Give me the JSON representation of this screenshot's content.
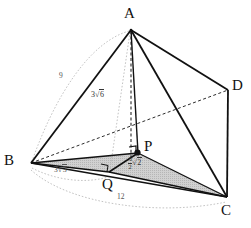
{
  "figure": {
    "background_color": "#ffffff",
    "stroke_color": "#111111",
    "hidden_stroke_color": "#333333",
    "guide_color": "#aaaaaa",
    "shaded_fill": "#c9c9c9"
  },
  "vertices": [
    {
      "id": "A",
      "label": "A",
      "x": 131,
      "y": 18,
      "label_x": 126,
      "label_y": 8,
      "point_x": 131,
      "point_y": 30
    },
    {
      "id": "B",
      "label": "B",
      "x": 31,
      "y": 163,
      "label_x": 5,
      "label_y": 155,
      "point_x": 31,
      "point_y": 163
    },
    {
      "id": "C",
      "label": "C",
      "x": 227,
      "y": 197,
      "label_x": 222,
      "label_y": 203,
      "point_x": 227,
      "point_y": 197
    },
    {
      "id": "D",
      "label": "D",
      "x": 228,
      "y": 90,
      "label_x": 233,
      "label_y": 79,
      "point_x": 228,
      "point_y": 90
    },
    {
      "id": "P",
      "label": "P",
      "x": 138,
      "y": 153,
      "label_x": 145,
      "label_y": 141,
      "point_x": 138,
      "point_y": 153
    },
    {
      "id": "Q",
      "label": "Q",
      "x": 109,
      "y": 172,
      "label_x": 103,
      "label_y": 178,
      "point_x": 109,
      "point_y": 172
    }
  ],
  "measurements": [
    {
      "id": "edge-AB",
      "text": "9",
      "kind": "plain",
      "x": 62,
      "y": 76
    },
    {
      "id": "edge-BQ",
      "text": "3√3",
      "kind": "radical",
      "coef": "3",
      "rad": "3",
      "x": 58,
      "y": 170
    },
    {
      "id": "edge-BC",
      "text": "12",
      "kind": "plain",
      "x": 120,
      "y": 196
    },
    {
      "id": "height-AQ",
      "text": "3√6",
      "kind": "radical",
      "coef": "3",
      "rad": "6",
      "x": 94,
      "y": 95
    },
    {
      "id": "seg-QP",
      "text": "3/2 √2",
      "kind": "fraction-radical",
      "num": "3",
      "den": "2",
      "rad": "2",
      "x": 129,
      "y": 159
    }
  ],
  "edges": [
    {
      "id": "AB",
      "from": "A",
      "to": "B",
      "style": "solid"
    },
    {
      "id": "AD",
      "from": "A",
      "to": "D",
      "style": "solid"
    },
    {
      "id": "AC",
      "from": "A",
      "to": "C",
      "style": "solid"
    },
    {
      "id": "AP",
      "from": "A",
      "to": "P",
      "style": "solid"
    },
    {
      "id": "AQ-height",
      "from": "A",
      "to": "Q",
      "style": "dashed-vertical"
    },
    {
      "id": "BD",
      "from": "B",
      "to": "D",
      "style": "dashed"
    },
    {
      "id": "BC",
      "from": "B",
      "to": "C",
      "style": "solid"
    },
    {
      "id": "BQ",
      "from": "B",
      "to": "Q",
      "style": "solid"
    },
    {
      "id": "DC",
      "from": "D",
      "to": "C",
      "style": "solid"
    },
    {
      "id": "QP",
      "from": "Q",
      "to": "P",
      "style": "solid"
    },
    {
      "id": "QC",
      "from": "Q",
      "to": "C",
      "style": "solid"
    },
    {
      "id": "PC",
      "from": "P",
      "to": "C",
      "style": "solid"
    }
  ],
  "guides": [
    {
      "id": "arc-AB-9",
      "label_ref": "edge-AB"
    },
    {
      "id": "arc-BQ-3r3",
      "label_ref": "edge-BQ"
    },
    {
      "id": "arc-BC-12",
      "label_ref": "edge-BC"
    },
    {
      "id": "line-AQ",
      "label_ref": "height-AQ"
    }
  ],
  "markers": [
    {
      "id": "right-angle-at-Q",
      "type": "right-angle-square",
      "x": 103,
      "y": 166
    },
    {
      "id": "right-angle-at-P",
      "type": "right-angle-square",
      "x": 131,
      "y": 148
    }
  ],
  "shaded_regions": [
    {
      "id": "triangle-BQC",
      "vertices": [
        "B",
        "Q",
        "C"
      ],
      "fill": "#c9c9c9"
    }
  ]
}
